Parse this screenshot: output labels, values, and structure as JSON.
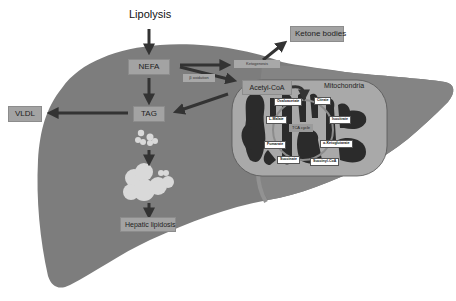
{
  "diagram": {
    "title": "Lipolysis",
    "colors": {
      "liver": "#7d7d7d",
      "liver_right_lobe": "#838383",
      "mitochondrion": "#a9a9a9",
      "cristae": "#2b2b2b",
      "label_box": "#a3a3a3",
      "arrow": "#333333",
      "lipid_droplet": "#d9d9d9"
    },
    "nodes": {
      "lipolysis": "Lipolysis",
      "nefa": "NEFA",
      "ketogenesis": "Ketogenesis",
      "ketone_bodies": "Ketone bodies",
      "beta_oxidation": "β oxidation",
      "acetyl_coa": "Acetyl-CoA",
      "mitochondria": "Mitochondria",
      "tag": "TAG",
      "vldl": "VLDL",
      "hepatic_lipidosis": "Hepatic lipidosis"
    },
    "tca_cycle": {
      "center": "TCA cycle",
      "intermediates": [
        "Oxaloacetate",
        "Citrate",
        "Isocitrate",
        "α-Ketoglutarate",
        "Succinyl-CoA",
        "Succinate",
        "Fumarate",
        "L-Malate"
      ]
    },
    "edges": [
      {
        "from": "Lipolysis",
        "to": "NEFA"
      },
      {
        "from": "NEFA",
        "to": "Ketogenesis"
      },
      {
        "from": "Ketogenesis",
        "to": "Ketone bodies"
      },
      {
        "from": "NEFA",
        "to": "Acetyl-CoA",
        "label": "β oxidation"
      },
      {
        "from": "NEFA",
        "to": "TAG"
      },
      {
        "from": "Acetyl-CoA",
        "to": "TAG"
      },
      {
        "from": "TAG",
        "to": "VLDL"
      },
      {
        "from": "TAG",
        "to": "lipid droplets"
      },
      {
        "from": "lipid droplets",
        "to": "Hepatic lipidosis"
      }
    ]
  }
}
